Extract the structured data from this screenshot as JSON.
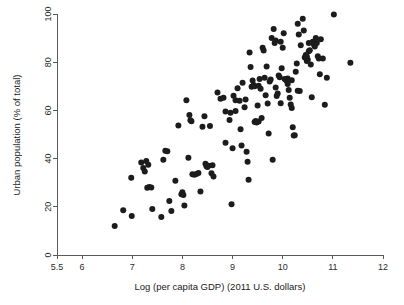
{
  "chart_data": {
    "type": "scatter",
    "title": "",
    "xlabel": "Log (per capita GDP) (2011 U.S. dollars)",
    "ylabel": "Urban population (% of total)",
    "xlim": [
      5.5,
      12
    ],
    "ylim": [
      0,
      100
    ],
    "xticks": [
      5.5,
      6,
      7,
      8,
      9,
      10,
      11,
      12
    ],
    "xtick_labels": [
      "5.5",
      "6",
      "7",
      "8",
      "9",
      "10",
      "11",
      "12"
    ],
    "yticks": [
      0,
      20,
      40,
      60,
      80,
      100
    ],
    "ytick_labels": [
      "0",
      "20",
      "40",
      "60",
      "80",
      "100"
    ],
    "grid": false,
    "legend": null,
    "marker": {
      "shape": "circle",
      "color": "#1c1c1c",
      "size_px": 6
    },
    "point_count": 152,
    "points": [
      [
        6.65,
        12.0
      ],
      [
        6.82,
        18.6
      ],
      [
        6.98,
        32.1
      ],
      [
        6.99,
        16.2
      ],
      [
        7.18,
        38.4
      ],
      [
        7.22,
        36.1
      ],
      [
        7.25,
        34.6
      ],
      [
        7.28,
        39.0
      ],
      [
        7.3,
        27.9
      ],
      [
        7.34,
        28.2
      ],
      [
        7.38,
        28.0
      ],
      [
        7.4,
        19.1
      ],
      [
        7.58,
        15.8
      ],
      [
        7.62,
        39.5
      ],
      [
        7.66,
        43.3
      ],
      [
        7.7,
        43.1
      ],
      [
        7.74,
        22.4
      ],
      [
        7.78,
        18.3
      ],
      [
        7.86,
        30.8
      ],
      [
        7.92,
        53.7
      ],
      [
        7.98,
        25.2
      ],
      [
        8.0,
        26.0
      ],
      [
        8.02,
        24.9
      ],
      [
        8.04,
        20.5
      ],
      [
        8.08,
        64.2
      ],
      [
        8.12,
        40.4
      ],
      [
        8.14,
        58.1
      ],
      [
        8.16,
        55.9
      ],
      [
        8.2,
        33.5
      ],
      [
        8.24,
        33.3
      ],
      [
        8.28,
        33.6
      ],
      [
        8.32,
        34.0
      ],
      [
        8.36,
        26.4
      ],
      [
        8.4,
        53.2
      ],
      [
        8.44,
        57.6
      ],
      [
        8.46,
        37.9
      ],
      [
        8.5,
        36.5
      ],
      [
        8.52,
        37.0
      ],
      [
        8.55,
        53.5
      ],
      [
        8.58,
        33.9
      ],
      [
        8.6,
        37.2
      ],
      [
        8.62,
        32.6
      ],
      [
        8.7,
        67.4
      ],
      [
        8.76,
        64.8
      ],
      [
        8.82,
        65.2
      ],
      [
        8.86,
        46.6
      ],
      [
        8.94,
        56.0
      ],
      [
        8.96,
        59.0
      ],
      [
        8.98,
        21.1
      ],
      [
        9.0,
        44.3
      ],
      [
        9.02,
        66.1
      ],
      [
        9.06,
        59.8
      ],
      [
        9.1,
        69.2
      ],
      [
        9.14,
        64.0
      ],
      [
        9.16,
        52.2
      ],
      [
        9.18,
        45.4
      ],
      [
        9.2,
        71.5
      ],
      [
        9.24,
        61.3
      ],
      [
        9.26,
        64.5
      ],
      [
        9.28,
        42.8
      ],
      [
        9.3,
        38.7
      ],
      [
        9.32,
        31.2
      ],
      [
        9.34,
        84.0
      ],
      [
        9.36,
        78.0
      ],
      [
        9.38,
        69.8
      ],
      [
        9.4,
        72.4
      ],
      [
        9.42,
        70.5
      ],
      [
        9.44,
        55.2
      ],
      [
        9.46,
        55.6
      ],
      [
        9.48,
        55.0
      ],
      [
        9.5,
        62.0
      ],
      [
        9.52,
        70.2
      ],
      [
        9.54,
        73.0
      ],
      [
        9.56,
        69.0
      ],
      [
        9.58,
        56.8
      ],
      [
        9.6,
        86.0
      ],
      [
        9.62,
        84.9
      ],
      [
        9.64,
        73.5
      ],
      [
        9.66,
        66.3
      ],
      [
        9.68,
        78.2
      ],
      [
        9.7,
        62.9
      ],
      [
        9.72,
        50.4
      ],
      [
        9.74,
        72.0
      ],
      [
        9.76,
        72.8
      ],
      [
        9.78,
        90.0
      ],
      [
        9.8,
        39.5
      ],
      [
        9.82,
        93.8
      ],
      [
        9.84,
        88.0
      ],
      [
        9.86,
        89.0
      ],
      [
        9.88,
        66.0
      ],
      [
        9.9,
        67.0
      ],
      [
        9.92,
        74.5
      ],
      [
        9.94,
        73.8
      ],
      [
        9.96,
        63.0
      ],
      [
        9.98,
        77.5
      ],
      [
        10.0,
        86.0
      ],
      [
        10.02,
        92.0
      ],
      [
        10.04,
        73.0
      ],
      [
        10.06,
        72.8
      ],
      [
        10.08,
        72.2
      ],
      [
        10.1,
        71.0
      ],
      [
        10.12,
        68.5
      ],
      [
        10.14,
        65.2
      ],
      [
        10.16,
        62.4
      ],
      [
        10.18,
        61.0
      ],
      [
        10.2,
        53.0
      ],
      [
        10.22,
        49.6
      ],
      [
        10.24,
        49.7
      ],
      [
        10.26,
        76.0
      ],
      [
        10.28,
        79.5
      ],
      [
        10.3,
        96.0
      ],
      [
        10.32,
        91.5
      ],
      [
        10.34,
        68.0
      ],
      [
        10.36,
        87.0
      ],
      [
        10.4,
        98.0
      ],
      [
        10.42,
        93.2
      ],
      [
        10.44,
        82.0
      ],
      [
        10.46,
        83.0
      ],
      [
        10.48,
        80.5
      ],
      [
        10.5,
        81.0
      ],
      [
        10.52,
        84.5
      ],
      [
        10.54,
        85.0
      ],
      [
        10.56,
        79.0
      ],
      [
        10.58,
        65.5
      ],
      [
        10.6,
        88.5
      ],
      [
        10.62,
        87.5
      ],
      [
        10.64,
        86.5
      ],
      [
        10.66,
        90.0
      ],
      [
        10.68,
        88.0
      ],
      [
        10.7,
        82.5
      ],
      [
        10.72,
        81.5
      ],
      [
        10.74,
        75.0
      ],
      [
        10.76,
        89.5
      ],
      [
        10.8,
        81.5
      ],
      [
        10.84,
        62.3
      ],
      [
        10.88,
        73.5
      ],
      [
        11.02,
        99.8
      ],
      [
        11.35,
        79.8
      ],
      [
        8.18,
        55.5
      ],
      [
        9.44,
        70.0
      ],
      [
        9.52,
        55.4
      ],
      [
        10.1,
        73.2
      ],
      [
        10.48,
        82.5
      ],
      [
        10.52,
        88.0
      ],
      [
        9.96,
        88.5
      ],
      [
        8.48,
        36.8
      ],
      [
        7.32,
        37.5
      ],
      [
        9.06,
        64.2
      ],
      [
        10.18,
        72.5
      ],
      [
        10.3,
        68.2
      ],
      [
        9.86,
        69.5
      ],
      [
        8.86,
        59.5
      ]
    ]
  },
  "axes": {
    "x_title": "Log (per capita GDP) (2011 U.S. dollars)",
    "y_title": "Urban population (% of total)"
  }
}
